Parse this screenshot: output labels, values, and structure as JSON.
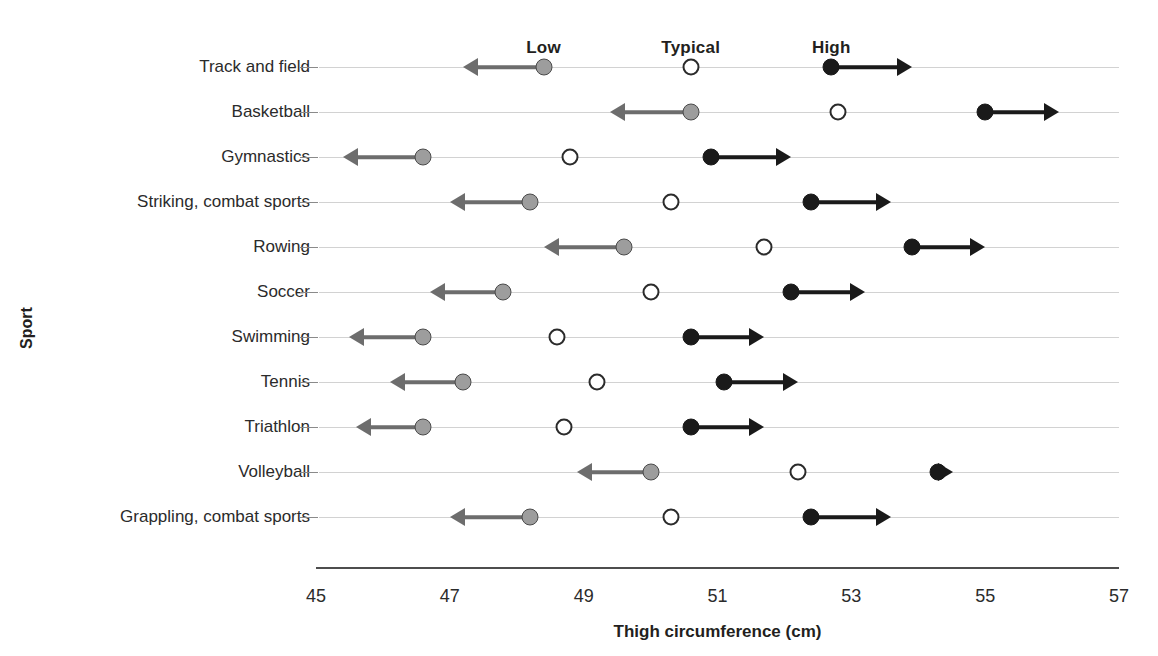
{
  "chart_data": {
    "type": "scatter",
    "title": "",
    "xlabel": "Thigh circumference (cm)",
    "ylabel": "Sport",
    "xlim": [
      45,
      57
    ],
    "xticks": [
      45,
      47,
      49,
      51,
      53,
      55,
      57
    ],
    "xtick_labels": [
      "45",
      "47",
      "49",
      "51",
      "53",
      "55",
      "57"
    ],
    "grid": true,
    "legend_position": "top",
    "column_headers": [
      {
        "label": "Low",
        "value": 48.4
      },
      {
        "label": "Typical",
        "value": 50.6
      },
      {
        "label": "High",
        "value": 52.7
      }
    ],
    "series": [
      {
        "name": "Low",
        "marker": "filled-gray-circle",
        "arrow": "left",
        "color": "#9d9d9d"
      },
      {
        "name": "Typical",
        "marker": "open-circle",
        "arrow": "none",
        "color": "#ffffff"
      },
      {
        "name": "High",
        "marker": "filled-black-circle",
        "arrow": "right",
        "color": "#1a1a1a"
      }
    ],
    "categories": [
      "Track and field",
      "Basketball",
      "Gymnastics",
      "Striking, combat sports",
      "Rowing",
      "Soccer",
      "Swimming",
      "Tennis",
      "Triathlon",
      "Volleyball",
      "Grappling, combat sports"
    ],
    "rows": [
      {
        "sport": "Track and field",
        "low": 48.4,
        "low_arrow_end": 47.2,
        "typical": 50.6,
        "high": 52.7,
        "high_arrow_end": 53.9
      },
      {
        "sport": "Basketball",
        "low": 50.6,
        "low_arrow_end": 49.4,
        "typical": 52.8,
        "high": 55.0,
        "high_arrow_end": 56.1
      },
      {
        "sport": "Gymnastics",
        "low": 46.6,
        "low_arrow_end": 45.4,
        "typical": 48.8,
        "high": 50.9,
        "high_arrow_end": 52.1
      },
      {
        "sport": "Striking, combat sports",
        "low": 48.2,
        "low_arrow_end": 47.0,
        "typical": 50.3,
        "high": 52.4,
        "high_arrow_end": 53.6
      },
      {
        "sport": "Rowing",
        "low": 49.6,
        "low_arrow_end": 48.4,
        "typical": 51.7,
        "high": 53.9,
        "high_arrow_end": 55.0
      },
      {
        "sport": "Soccer",
        "low": 47.8,
        "low_arrow_end": 46.7,
        "typical": 50.0,
        "high": 52.1,
        "high_arrow_end": 53.2
      },
      {
        "sport": "Swimming",
        "low": 46.6,
        "low_arrow_end": 45.5,
        "typical": 48.6,
        "high": 50.6,
        "high_arrow_end": 51.7
      },
      {
        "sport": "Tennis",
        "low": 47.2,
        "low_arrow_end": 46.1,
        "typical": 49.2,
        "high": 51.1,
        "high_arrow_end": 52.2
      },
      {
        "sport": "Triathlon",
        "low": 46.6,
        "low_arrow_end": 45.6,
        "typical": 48.7,
        "high": 50.6,
        "high_arrow_end": 51.7
      },
      {
        "sport": "Volleyball",
        "low": 50.0,
        "low_arrow_end": 48.9,
        "typical": 52.2,
        "high": 54.3,
        "high_arrow_end": 54.5
      },
      {
        "sport": "Grappling, combat sports",
        "low": 48.2,
        "low_arrow_end": 47.0,
        "typical": 50.3,
        "high": 52.4,
        "high_arrow_end": 53.6
      }
    ]
  },
  "geometry": {
    "plot_left_px": 316,
    "plot_right_px": 1119,
    "first_row_y_px": 67,
    "row_step_px": 45,
    "axis_y_px": 567,
    "header_y_px": 38,
    "xtick_label_y_px": 586,
    "xtitle_y_px": 622
  }
}
